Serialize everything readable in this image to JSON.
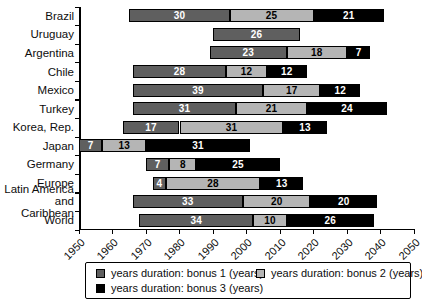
{
  "chart_data": {
    "type": "bar",
    "subtype": "horizontal-stacked-timeline",
    "x_axis": {
      "min": 1950,
      "max": 2050,
      "tick_interval": 10,
      "tick_labels": [
        "1950",
        "1960",
        "1970",
        "1980",
        "1990",
        "2000",
        "2010",
        "2020",
        "2030",
        "2040",
        "2050"
      ]
    },
    "legend": [
      {
        "label": "years duration: bonus 1 (years)",
        "color": "#5f5f5f"
      },
      {
        "label": "years duration: bonus 2 (years)",
        "color": "#b5b5b5"
      },
      {
        "label": "years duration: bonus 3 (years)",
        "color": "#000000"
      }
    ],
    "text_colors": {
      "bonus1": "#ffffff",
      "bonus2": "#000000",
      "bonus3": "#ffffff"
    },
    "rows": [
      {
        "country": "Brazil",
        "start_year": 1965,
        "bonus1": 30,
        "bonus2": 25,
        "bonus3": 21
      },
      {
        "country": "Uruguay",
        "start_year": 1990,
        "bonus1": 26,
        "bonus2": null,
        "bonus3": null
      },
      {
        "country": "Argentina",
        "start_year": 1989,
        "bonus1": 23,
        "bonus2": 18,
        "bonus3": 7
      },
      {
        "country": "Chile",
        "start_year": 1966,
        "bonus1": 28,
        "bonus2": 12,
        "bonus3": 12
      },
      {
        "country": "Mexico",
        "start_year": 1966,
        "bonus1": 39,
        "bonus2": 17,
        "bonus3": 12
      },
      {
        "country": "Turkey",
        "start_year": 1966,
        "bonus1": 31,
        "bonus2": 21,
        "bonus3": 24
      },
      {
        "country": "Korea, Rep.",
        "start_year": 1963,
        "bonus1": 17,
        "bonus2": 31,
        "bonus3": 13
      },
      {
        "country": "Japan",
        "start_year": 1950,
        "bonus1": 7,
        "bonus2": 13,
        "bonus3": 31
      },
      {
        "country": "Germany",
        "start_year": 1970,
        "bonus1": 7,
        "bonus2": 8,
        "bonus3": 25
      },
      {
        "country": "Europe",
        "start_year": 1972,
        "bonus1": 4,
        "bonus2": 28,
        "bonus3": 13
      },
      {
        "country": "Latin America and Caribbean",
        "start_year": 1966,
        "bonus1": 33,
        "bonus2": 20,
        "bonus3": 20
      },
      {
        "country": "World",
        "start_year": 1968,
        "bonus1": 34,
        "bonus2": 10,
        "bonus3": 26
      }
    ]
  }
}
